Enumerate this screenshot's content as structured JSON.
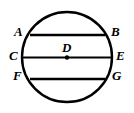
{
  "figure": {
    "type": "geometry-diagram",
    "background_color": "#ffffff",
    "stroke_color": "#000000",
    "circle": {
      "center_x": 67,
      "center_y": 57,
      "radius": 45,
      "stroke_width": 2.4
    },
    "center_point": {
      "label": "D",
      "x": 67,
      "y": 57.5,
      "dot_radius": 2.2
    },
    "chords": [
      {
        "name": "chord-AB",
        "y": 35,
        "x1": 30,
        "x2": 105,
        "stroke_width": 2.6,
        "left_label": "A",
        "right_label": "B"
      },
      {
        "name": "chord-CE",
        "y": 57.5,
        "x1": 22,
        "x2": 112,
        "stroke_width": 2.2,
        "left_label": "C",
        "right_label": "E"
      },
      {
        "name": "chord-FG",
        "y": 79,
        "x1": 30,
        "x2": 105,
        "stroke_width": 2.6,
        "left_label": "F",
        "right_label": "G"
      }
    ],
    "labels": {
      "A": "A",
      "B": "B",
      "C": "C",
      "D": "D",
      "E": "E",
      "F": "F",
      "G": "G"
    }
  }
}
